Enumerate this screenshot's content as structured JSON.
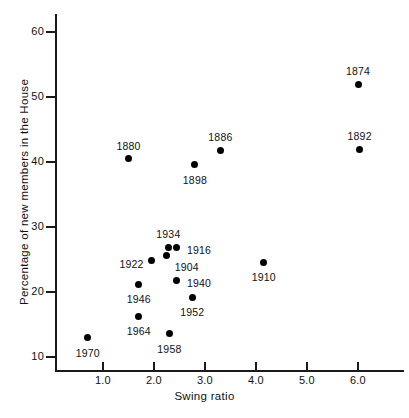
{
  "chart_data": {
    "type": "scatter",
    "title": "",
    "xlabel": "Swing ratio",
    "ylabel": "Percentage of new members in the House",
    "xlim": [
      0.3,
      6.55
    ],
    "ylim": [
      8.0,
      61.5
    ],
    "xticks": [
      "1.0",
      "2.0",
      "3.0",
      "4.0",
      "5.0",
      "6.0"
    ],
    "xtick_values": [
      1.0,
      2.0,
      3.0,
      4.0,
      5.0,
      6.0
    ],
    "yticks": [
      "10",
      "20",
      "30",
      "40",
      "50",
      "60"
    ],
    "ytick_values": [
      10,
      20,
      30,
      40,
      50,
      60
    ],
    "grid": false,
    "legend": "none",
    "marker_color": "#000000",
    "axis_color": "#1a1a1a",
    "points": [
      {
        "label": "1874",
        "x": 6.0,
        "y": 52.0,
        "label_dx": 0,
        "label_dy": -13
      },
      {
        "label": "1892",
        "x": 6.03,
        "y": 42.0,
        "label_dx": 0,
        "label_dy": -13
      },
      {
        "label": "1886",
        "x": 3.3,
        "y": 41.8,
        "label_dx": 0,
        "label_dy": -13
      },
      {
        "label": "1880",
        "x": 1.5,
        "y": 40.5,
        "label_dx": 0,
        "label_dy": -13
      },
      {
        "label": "1898",
        "x": 2.8,
        "y": 39.6,
        "label_dx": 0,
        "label_dy": 15
      },
      {
        "label": "1916",
        "x": 2.45,
        "y": 26.9,
        "label_dx": 24,
        "label_dy": 3
      },
      {
        "label": "1934",
        "x": 2.28,
        "y": 26.9,
        "label_dx": 0,
        "label_dy": -13
      },
      {
        "label": "1904",
        "x": 2.25,
        "y": 25.6,
        "label_dx": 22,
        "label_dy": 11
      },
      {
        "label": "1922",
        "x": 1.95,
        "y": 24.8,
        "label_dx": -24,
        "label_dy": 3
      },
      {
        "label": "1910",
        "x": 4.15,
        "y": 24.6,
        "label_dx": 0,
        "label_dy": 15
      },
      {
        "label": "1940",
        "x": 2.45,
        "y": 21.8,
        "label_dx": 24,
        "label_dy": 3
      },
      {
        "label": "1946",
        "x": 1.7,
        "y": 21.2,
        "label_dx": 0,
        "label_dy": 15
      },
      {
        "label": "1952",
        "x": 2.75,
        "y": 19.2,
        "label_dx": 0,
        "label_dy": 15
      },
      {
        "label": "1964",
        "x": 1.7,
        "y": 16.3,
        "label_dx": 0,
        "label_dy": 15
      },
      {
        "label": "1958",
        "x": 2.3,
        "y": 13.6,
        "label_dx": 0,
        "label_dy": 15
      },
      {
        "label": "1970",
        "x": 0.7,
        "y": 13.0,
        "label_dx": 0,
        "label_dy": 15
      }
    ]
  }
}
